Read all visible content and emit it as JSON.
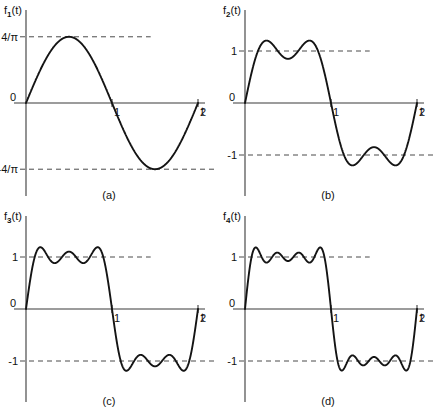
{
  "figure": {
    "background_color": "#ffffff",
    "curve_color": "#141414",
    "axis_color": "#3a3a3a",
    "dash_color": "#4a4a4a"
  },
  "panels": [
    {
      "id": "a",
      "caption": "(a)",
      "function_label": "f",
      "function_sub": "1",
      "function_suffix": "(t)",
      "origin_label": "0",
      "axis_var": "t",
      "x_ticks": [
        "1",
        "2"
      ],
      "y_pos_label": "4/π",
      "y_neg_label": "-4/π",
      "terms": 1
    },
    {
      "id": "b",
      "caption": "(b)",
      "function_label": "f",
      "function_sub": "2",
      "function_suffix": "(t)",
      "origin_label": "0",
      "axis_var": "t",
      "x_ticks": [
        "1",
        "2"
      ],
      "y_pos_label": "1",
      "y_neg_label": "-1",
      "terms": 2
    },
    {
      "id": "c",
      "caption": "(c)",
      "function_label": "f",
      "function_sub": "3",
      "function_suffix": "(t)",
      "origin_label": "0",
      "axis_var": "t",
      "x_ticks": [
        "1",
        "2"
      ],
      "y_pos_label": "1",
      "y_neg_label": "-1",
      "terms": 3
    },
    {
      "id": "d",
      "caption": "(d)",
      "function_label": "f",
      "function_sub": "4",
      "function_suffix": "(t)",
      "origin_label": "0",
      "axis_var": "t",
      "x_ticks": [
        "1",
        "2"
      ],
      "y_pos_label": "1",
      "y_neg_label": "-1",
      "terms": 4
    }
  ],
  "chart_data": [
    {
      "type": "line",
      "panel": "a",
      "title": "f1(t)",
      "xlabel": "t",
      "ylabel": "f1(t)",
      "xlim": [
        0,
        2.25
      ],
      "ylim": [
        -1.6,
        1.6
      ],
      "x_ticks": [
        1,
        2
      ],
      "y_ticks": [
        1.2732,
        -1.2732
      ],
      "y_tick_labels": [
        "4/π",
        "-4/π"
      ],
      "grid": false,
      "legend": "none",
      "formula": "f1(t) = (4/pi) * sin(pi*t)",
      "harmonics": [
        1
      ],
      "coefficients": [
        1.2732
      ],
      "amplitude": 1.2732,
      "dashed_guides": [
        1.2732,
        -1.2732
      ],
      "series": [
        {
          "name": "f1",
          "x": [
            0,
            0.1,
            0.2,
            0.3,
            0.4,
            0.5,
            0.6,
            0.7,
            0.8,
            0.9,
            1.0,
            1.1,
            1.2,
            1.3,
            1.4,
            1.5,
            1.6,
            1.7,
            1.8,
            1.9,
            2.0
          ],
          "y": [
            0,
            0.3934,
            0.7483,
            1.0301,
            1.2108,
            1.2732,
            1.2108,
            1.0301,
            0.7483,
            0.3934,
            0,
            -0.3934,
            -0.7483,
            -1.0301,
            -1.2108,
            -1.2732,
            -1.2108,
            -1.0301,
            -0.7483,
            -0.3934,
            0
          ]
        }
      ]
    },
    {
      "type": "line",
      "panel": "b",
      "title": "f2(t)",
      "xlabel": "t",
      "ylabel": "f2(t)",
      "xlim": [
        0,
        2.25
      ],
      "ylim": [
        -1.6,
        1.6
      ],
      "x_ticks": [
        1,
        2
      ],
      "y_ticks": [
        1,
        -1
      ],
      "y_tick_labels": [
        "1",
        "-1"
      ],
      "grid": false,
      "legend": "none",
      "formula": "f2(t) = (4/pi) * [sin(pi*t) + sin(3*pi*t)/3]",
      "harmonics": [
        1,
        3
      ],
      "coefficients": [
        1.2732,
        0.4244
      ],
      "ripples_per_half_period": 2,
      "dashed_guides": [
        1,
        -1
      ],
      "series": [
        {
          "name": "f2",
          "x": [
            0,
            0.1,
            0.2,
            0.3,
            0.4,
            0.5,
            0.6,
            0.7,
            0.8,
            0.9,
            1.0,
            1.1,
            1.2,
            1.3,
            1.4,
            1.5,
            1.6,
            1.7,
            1.8,
            1.9,
            2.0
          ],
          "y": [
            0,
            0.7368,
            1.1519,
            1.1735,
            0.9614,
            0.8488,
            0.9614,
            1.1735,
            1.1519,
            0.7368,
            0,
            -0.7368,
            -1.1519,
            -1.1735,
            -0.9614,
            -0.8488,
            -0.9614,
            -1.1735,
            -1.1519,
            -0.7368,
            0
          ]
        }
      ]
    },
    {
      "type": "line",
      "panel": "c",
      "title": "f3(t)",
      "xlabel": "t",
      "ylabel": "f3(t)",
      "xlim": [
        0,
        2.25
      ],
      "ylim": [
        -1.6,
        1.6
      ],
      "x_ticks": [
        1,
        2
      ],
      "y_ticks": [
        1,
        -1
      ],
      "y_tick_labels": [
        "1",
        "-1"
      ],
      "grid": false,
      "legend": "none",
      "formula": "f3(t) = (4/pi) * [sin(pi*t) + sin(3*pi*t)/3 + sin(5*pi*t)/5]",
      "harmonics": [
        1,
        3,
        5
      ],
      "coefficients": [
        1.2732,
        0.4244,
        0.2546
      ],
      "ripples_per_half_period": 3,
      "dashed_guides": [
        1,
        -1
      ],
      "series": [
        {
          "name": "f3",
          "x": [
            0,
            0.1,
            0.2,
            0.3,
            0.4,
            0.5,
            0.6,
            0.7,
            0.8,
            0.9,
            1.0,
            1.1,
            1.2,
            1.3,
            1.4,
            1.5,
            1.6,
            1.7,
            1.8,
            1.9,
            2.0
          ],
          "y": [
            0,
            0.8861,
            1.1519,
            0.9239,
            1.0035,
            1.1034,
            1.0035,
            0.9239,
            1.1519,
            0.8861,
            0,
            -0.8861,
            -1.1519,
            -0.9239,
            -1.0035,
            -1.1034,
            -1.0035,
            -0.9239,
            -1.1519,
            -0.8861,
            0
          ]
        }
      ]
    },
    {
      "type": "line",
      "panel": "d",
      "title": "f4(t)",
      "xlabel": "t",
      "ylabel": "f4(t)",
      "xlim": [
        0,
        2.25
      ],
      "ylim": [
        -1.6,
        1.6
      ],
      "x_ticks": [
        1,
        2
      ],
      "y_ticks": [
        1,
        -1
      ],
      "y_tick_labels": [
        "1",
        "-1"
      ],
      "grid": false,
      "legend": "none",
      "formula": "f4(t) = (4/pi) * [sin(pi*t) + sin(3*pi*t)/3 + sin(5*pi*t)/5 + sin(7*pi*t)/7]",
      "harmonics": [
        1,
        3,
        5,
        7
      ],
      "coefficients": [
        1.2732,
        0.4244,
        0.2546,
        0.1819
      ],
      "ripples_per_half_period": 4,
      "dashed_guides": [
        1,
        -1
      ],
      "series": [
        {
          "name": "f4",
          "x": [
            0,
            0.1,
            0.2,
            0.3,
            0.4,
            0.5,
            0.6,
            0.7,
            0.8,
            0.9,
            1.0,
            1.1,
            1.2,
            1.3,
            1.4,
            1.5,
            1.6,
            1.7,
            1.8,
            1.9,
            2.0
          ],
          "y": [
            0,
            1.0589,
            1.0452,
            1.0305,
            0.9606,
            0.9551,
            0.9606,
            1.0305,
            1.0452,
            1.0589,
            0,
            -1.0589,
            -1.0452,
            -1.0305,
            -0.9606,
            -0.9551,
            -0.9606,
            -1.0305,
            -1.0452,
            -1.0589,
            0
          ]
        }
      ]
    }
  ]
}
